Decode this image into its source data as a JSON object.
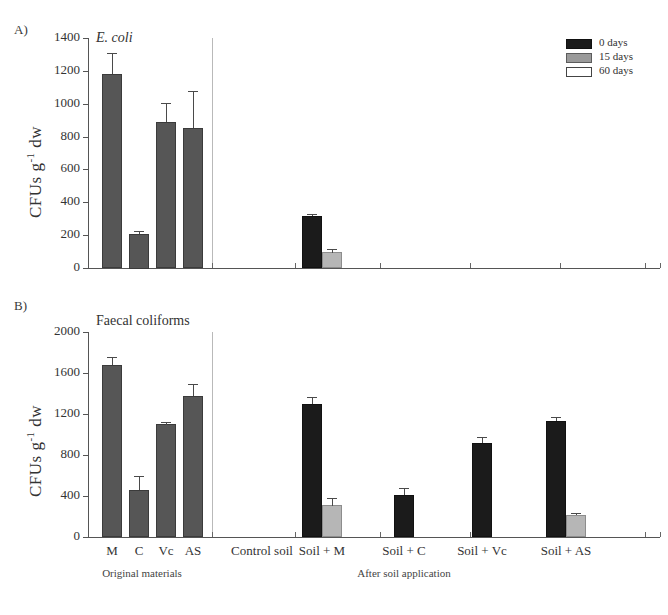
{
  "figure": {
    "panelA_letter": "A)",
    "panelB_letter": "B)"
  },
  "legend": {
    "items": [
      {
        "label": "0 days",
        "swatch": "dark-swatch",
        "color": "#1b1b1b"
      },
      {
        "label": "15 days",
        "swatch": "gray-swatch",
        "color": "#9a9a9a"
      },
      {
        "label": "60 days",
        "swatch": "white-swatch",
        "color": "#ffffff"
      }
    ]
  },
  "axis": {
    "ylabel_main": "CFUs g",
    "ylabel_sup": "-1",
    "ylabel_tail": " dw",
    "group_left": "Original materials",
    "group_right": "After soil application",
    "categories": [
      "M",
      "C",
      "Vc",
      "AS",
      "Control soil",
      "Soil + M",
      "Soil + C",
      "Soil + Vc",
      "Soil + AS"
    ],
    "panelA_ticks": [
      "0",
      "200",
      "400",
      "600",
      "800",
      "1000",
      "1200",
      "1400"
    ],
    "panelB_ticks": [
      "0",
      "400",
      "800",
      "1200",
      "1600",
      "2000"
    ]
  },
  "chart_data": [
    {
      "type": "bar",
      "panel": "A",
      "title": "E. coli",
      "title_italic": true,
      "xlabel": "",
      "ylabel": "CFUs g-1 dw",
      "ylim": [
        0,
        1400
      ],
      "ytick_step": 200,
      "grid": false,
      "legend_position": "top-right",
      "categories": [
        "M",
        "C",
        "Vc",
        "AS",
        "Control soil",
        "Soil + M",
        "Soil + C",
        "Soil + Vc",
        "Soil + AS"
      ],
      "category_groups": [
        "Original materials",
        "Original materials",
        "Original materials",
        "Original materials",
        "After soil application",
        "After soil application",
        "After soil application",
        "After soil application",
        "After soil application"
      ],
      "series": [
        {
          "name": "0 days",
          "color": "#1b1b1b",
          "values": [
            1180,
            210,
            890,
            855,
            0,
            315,
            0,
            0,
            0
          ],
          "errors": [
            130,
            18,
            115,
            225,
            0,
            12,
            0,
            0,
            0
          ]
        },
        {
          "name": "15 days",
          "color": "#9a9a9a",
          "values": [
            0,
            0,
            0,
            0,
            0,
            95,
            0,
            0,
            0
          ],
          "errors": [
            0,
            0,
            0,
            0,
            0,
            22,
            0,
            0,
            0
          ]
        },
        {
          "name": "60 days",
          "color": "#ffffff",
          "values": [
            0,
            0,
            0,
            0,
            0,
            0,
            0,
            0,
            0
          ],
          "errors": [
            0,
            0,
            0,
            0,
            0,
            0,
            0,
            0,
            0
          ]
        }
      ],
      "note": "Original materials bars (M, C, Vc, AS) drawn in medium gray fill at 0 days"
    },
    {
      "type": "bar",
      "panel": "B",
      "title": "Faecal coliforms",
      "title_italic": false,
      "xlabel": "",
      "ylabel": "CFUs g-1 dw",
      "ylim": [
        0,
        2000
      ],
      "ytick_step": 400,
      "grid": false,
      "legend_position": "none",
      "categories": [
        "M",
        "C",
        "Vc",
        "AS",
        "Control soil",
        "Soil + M",
        "Soil + C",
        "Soil + Vc",
        "Soil + AS"
      ],
      "category_groups": [
        "Original materials",
        "Original materials",
        "Original materials",
        "Original materials",
        "After soil application",
        "After soil application",
        "After soil application",
        "After soil application",
        "After soil application"
      ],
      "series": [
        {
          "name": "0 days",
          "color": "#1b1b1b",
          "values": [
            1680,
            455,
            1100,
            1380,
            0,
            1300,
            410,
            920,
            1130
          ],
          "errors": [
            75,
            140,
            25,
            115,
            0,
            65,
            70,
            60,
            40
          ]
        },
        {
          "name": "15 days",
          "color": "#9a9a9a",
          "values": [
            0,
            0,
            0,
            0,
            0,
            310,
            0,
            0,
            210
          ],
          "errors": [
            0,
            0,
            0,
            0,
            0,
            75,
            0,
            0,
            22
          ]
        },
        {
          "name": "60 days",
          "color": "#ffffff",
          "values": [
            0,
            0,
            0,
            0,
            0,
            0,
            0,
            0,
            0
          ],
          "errors": [
            0,
            0,
            0,
            0,
            0,
            0,
            0,
            0,
            0
          ]
        }
      ],
      "note": "Original materials bars (M, C, Vc, AS) drawn in medium gray fill at 0 days"
    }
  ]
}
